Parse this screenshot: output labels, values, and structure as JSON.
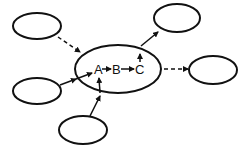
{
  "diagram": {
    "colors": {
      "stroke": "#111111",
      "background": "#ffffff"
    },
    "central_node": {
      "labels": [
        "A",
        "B",
        "C"
      ],
      "internal_flow": "A → B → C"
    },
    "satellite_nodes": [
      {
        "id": "top-left",
        "label": ""
      },
      {
        "id": "left",
        "label": ""
      },
      {
        "id": "bottom",
        "label": ""
      },
      {
        "id": "top-right",
        "label": ""
      },
      {
        "id": "right",
        "label": ""
      }
    ],
    "edges": [
      {
        "from": "top-left",
        "to": "central",
        "style": "dashed"
      },
      {
        "from": "left",
        "to": "A",
        "style": "solid"
      },
      {
        "from": "bottom",
        "to": "A",
        "style": "solid"
      },
      {
        "from": "A",
        "to": "B",
        "style": "solid"
      },
      {
        "from": "B",
        "to": "C",
        "style": "solid"
      },
      {
        "from": "central",
        "to": "C",
        "style": "solid"
      },
      {
        "from": "central",
        "to": "top-right",
        "style": "solid"
      },
      {
        "from": "central",
        "to": "right",
        "style": "dashed"
      }
    ]
  }
}
